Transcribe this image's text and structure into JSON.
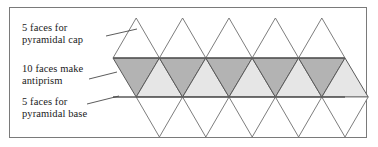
{
  "figure": {
    "border_color": "#7a7a7a",
    "background": "#ffffff",
    "labels": [
      {
        "id": "cap",
        "name": "label-pyramidal-cap",
        "text": "5 faces for\npyramidal cap"
      },
      {
        "id": "anti",
        "name": "label-antiprism",
        "text": "10 faces make\nantiprism"
      },
      {
        "id": "base",
        "name": "label-pyramidal-base",
        "text": "5 faces for\npyramidal base"
      }
    ],
    "leader_lines": [
      {
        "id": "leader-cap",
        "x1": 106,
        "y1": 36,
        "x2": 137,
        "y2": 29
      },
      {
        "id": "leader-anti",
        "x1": 89,
        "y1": 79,
        "x2": 117,
        "y2": 72
      },
      {
        "id": "leader-base",
        "x1": 87,
        "y1": 104,
        "x2": 119,
        "y2": 96
      }
    ]
  },
  "net": {
    "strip_left": 113,
    "strip_right": 345,
    "band_top": 58,
    "band_bottom": 97,
    "cap_apex_y": 18,
    "base_apex_y": 137,
    "triangle_count_cap": 5,
    "triangle_count_antiprism": 10,
    "triangle_count_base": 5,
    "colors": {
      "edge": "#6e6e6e",
      "band_edge": "#5a5a5a",
      "dark_face": "#b3b3b3",
      "light_face": "#e6e6e6",
      "unshaded_face": "#ffffff"
    }
  }
}
